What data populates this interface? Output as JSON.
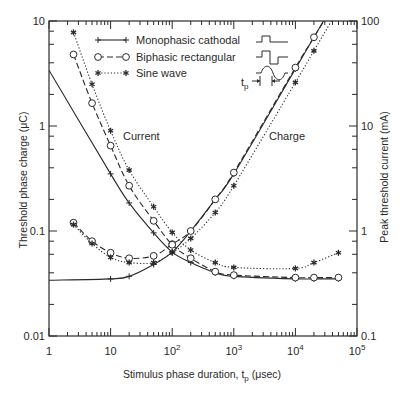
{
  "chart_data": {
    "type": "line",
    "title": "",
    "xlabel": "Stimulus phase duration, t_p (μsec)",
    "ylabel": "Threshold phase charge (μC)",
    "ylabel_right": "Peak threshold current (mA)",
    "xscale": "log",
    "yscale": "log",
    "xlim": [
      1,
      100000
    ],
    "ylim": [
      0.01,
      10
    ],
    "ylim_right": [
      0.1,
      100
    ],
    "x_ticks": [
      "1",
      "10",
      "10²",
      "10³",
      "10⁴",
      "10⁵"
    ],
    "y_ticks": [
      "0.01",
      "0.1",
      "1",
      "10"
    ],
    "y_ticks_right": [
      "0.1",
      "1",
      "10",
      "100"
    ],
    "grid": false,
    "legend_position": "upper center",
    "legend": [
      "Monophasic cathodal",
      "Biphasic rectangular",
      "Sine wave"
    ],
    "annotations": [
      "Current",
      "Charge",
      "t_p"
    ],
    "series": [
      {
        "name": "Monophasic cathodal",
        "quantity": "Charge (μC)",
        "style": "solid",
        "marker": "+",
        "x": [
          1,
          10,
          20,
          50,
          100,
          200,
          500,
          1000,
          10000,
          20000
        ],
        "values": [
          0.034,
          0.035,
          0.037,
          0.048,
          0.063,
          0.1,
          0.2,
          0.35,
          3.5,
          7.0
        ]
      },
      {
        "name": "Biphasic rectangular",
        "quantity": "Charge (μC)",
        "style": "dashed",
        "marker": "o",
        "x": [
          2.5,
          5,
          10,
          20,
          50,
          100,
          200,
          500,
          1000,
          10000,
          20000
        ],
        "values": [
          0.12,
          0.08,
          0.062,
          0.055,
          0.058,
          0.075,
          0.1,
          0.2,
          0.36,
          3.6,
          7.0
        ]
      },
      {
        "name": "Sine wave",
        "quantity": "Charge (μC)",
        "style": "dotted",
        "marker": "*",
        "x": [
          2.5,
          5,
          10,
          20,
          50,
          100,
          200,
          500,
          1000,
          10000,
          20000
        ],
        "values": [
          0.115,
          0.076,
          0.056,
          0.05,
          0.05,
          0.062,
          0.085,
          0.15,
          0.27,
          2.6,
          5.2
        ]
      },
      {
        "name": "Monophasic cathodal",
        "quantity": "Current (mA)",
        "style": "solid",
        "marker": "+",
        "x": [
          1,
          10,
          20,
          50,
          100,
          200,
          500,
          1000,
          10000,
          20000,
          50000
        ],
        "values": [
          34,
          3.5,
          1.85,
          0.96,
          0.63,
          0.5,
          0.4,
          0.37,
          0.35,
          0.35,
          0.35
        ]
      },
      {
        "name": "Biphasic rectangular",
        "quantity": "Current (mA)",
        "style": "dashed",
        "marker": "o",
        "x": [
          2.5,
          5,
          10,
          20,
          50,
          100,
          200,
          500,
          1000,
          10000,
          20000,
          50000
        ],
        "values": [
          48,
          16.5,
          6.5,
          2.7,
          1.25,
          0.74,
          0.55,
          0.41,
          0.38,
          0.36,
          0.36,
          0.36
        ]
      },
      {
        "name": "Sine wave",
        "quantity": "Current (mA)",
        "style": "dotted",
        "marker": "*",
        "x": [
          2.5,
          5,
          10,
          20,
          50,
          100,
          200,
          500,
          1000,
          10000,
          20000,
          50000
        ],
        "values": [
          78,
          25,
          9.0,
          3.8,
          1.7,
          0.97,
          0.66,
          0.5,
          0.45,
          0.44,
          0.5,
          0.62
        ]
      }
    ]
  },
  "labels": {
    "current": "Current",
    "charge": "Charge",
    "tp": "t",
    "tp_sub": "p",
    "xlabel_main": "Stimulus phase duration, t",
    "xlabel_sub": "p",
    "xlabel_unit": " (μsec)",
    "ylabel_left": "Threshold phase charge (μC)",
    "ylabel_right": "Peak threshold current (mA)"
  }
}
